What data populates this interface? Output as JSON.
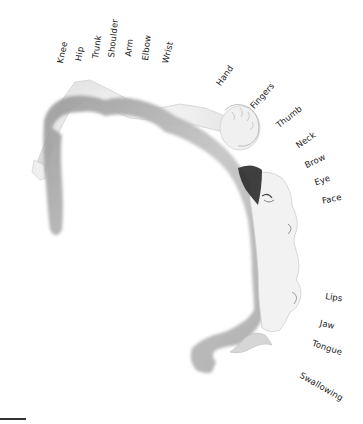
{
  "diagram": {
    "type": "motor-homunculus",
    "labels": {
      "knee": "Knee",
      "hip": "Hip",
      "trunk": "Trunk",
      "shoulder": "Shoulder",
      "arm": "Arm",
      "elbow": "Elbow",
      "wrist": "Wrist",
      "hand": "Hand",
      "fingers": "Fingers",
      "thumb": "Thumb",
      "neck": "Neck",
      "brow": "Brow",
      "eye": "Eye",
      "face": "Face",
      "lips": "Lips",
      "jaw": "Jaw",
      "tongue": "Tongue",
      "swallowing": "Swallowing"
    },
    "colors": {
      "cortex_dark": "#8a8a8a",
      "cortex_light": "#e6e6e6",
      "body": "#eeeeee",
      "hair": "#2b2b2b",
      "text": "#1a1a1a"
    }
  }
}
